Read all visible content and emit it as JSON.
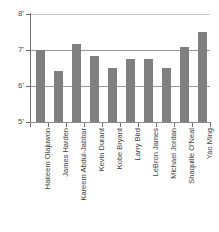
{
  "chart_data": {
    "type": "bar",
    "title": "",
    "xlabel": "",
    "ylabel": "",
    "categories": [
      "Hakeem Olajuwon",
      "James Harden",
      "Kareem Abdul-Jabbar",
      "Kevin Durant",
      "Kobe Bryant",
      "Larry Bird",
      "LeBron James",
      "Michael Jordan",
      "Shaquille O'Neal",
      "Yao Ming"
    ],
    "values": [
      7.0,
      6.42,
      7.17,
      6.83,
      6.5,
      6.75,
      6.75,
      6.5,
      7.08,
      7.5
    ],
    "ylim": [
      5,
      8
    ],
    "ytick_values": [
      8,
      7,
      6,
      5
    ],
    "ytick_labels": [
      "8'",
      "7'",
      "6'",
      "5'"
    ],
    "grid": true,
    "legend": "none",
    "bar_color": "#808080",
    "gridline_color": "#9a9a9a",
    "axis_color": "#6e6e6e",
    "background_color": "#ffffff"
  }
}
